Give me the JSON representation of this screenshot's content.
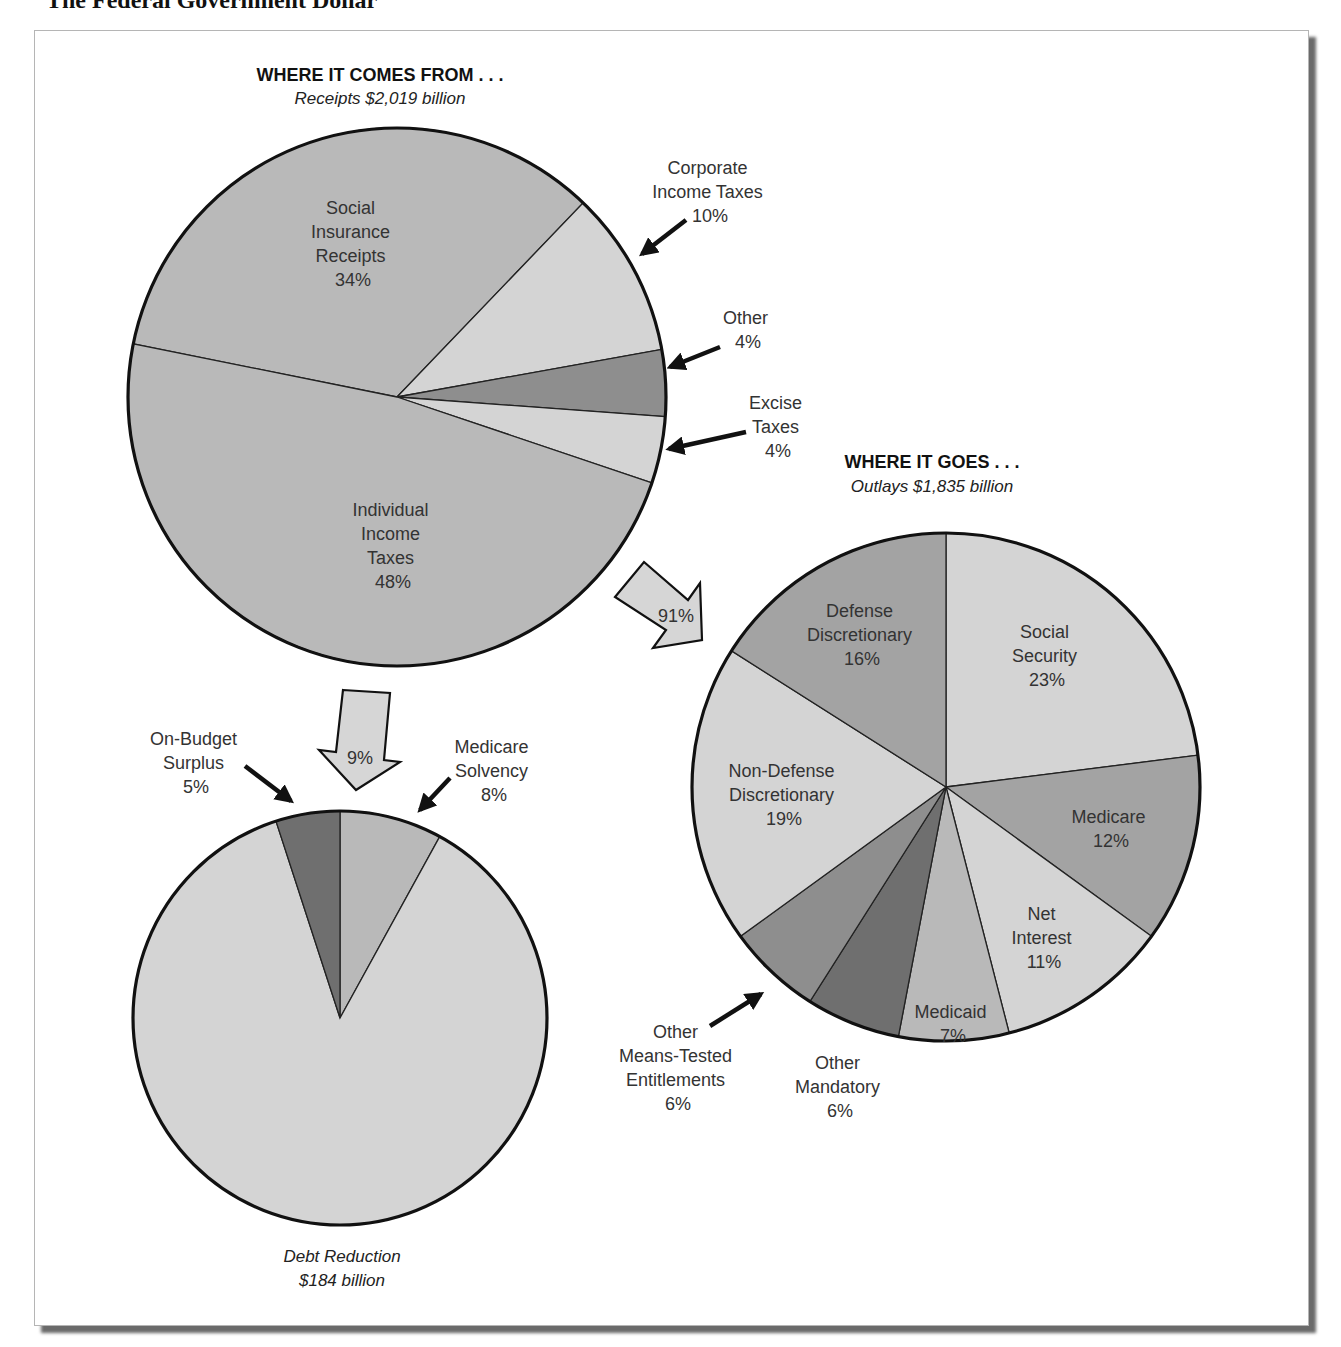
{
  "page": {
    "title": "The Federal Government Dollar"
  },
  "receipts": {
    "header": "WHERE IT COMES FROM . . .",
    "subheader": "Receipts $2,019 billion"
  },
  "outlays": {
    "header": "WHERE IT GOES . . .",
    "subheader": "Outlays $1,835 billion"
  },
  "debt": {
    "caption_line1": "Debt Reduction",
    "caption_line2": "$184 billion"
  },
  "flows": {
    "to_outlays": "91%",
    "to_debt": "9%"
  },
  "colors": {
    "light": "#d4d4d4",
    "mid": "#b9b9b9",
    "midDark": "#a3a3a3",
    "dark": "#8e8e8e",
    "darkest": "#6f6f6f",
    "outline": "#111111"
  },
  "chart_data": [
    {
      "type": "pie",
      "title": "WHERE IT COMES FROM . . .",
      "subtitle": "Receipts $2,019 billion",
      "categories": [
        "Social Insurance Receipts",
        "Corporate Income Taxes",
        "Other",
        "Excise Taxes",
        "Individual Income Taxes"
      ],
      "values": [
        34,
        10,
        4,
        4,
        48
      ],
      "unit": "%"
    },
    {
      "type": "pie",
      "title": "WHERE IT GOES . . .",
      "subtitle": "Outlays $1,835 billion",
      "categories": [
        "Social Security",
        "Medicare",
        "Net Interest",
        "Medicaid",
        "Other Mandatory",
        "Other Means-Tested Entitlements",
        "Non-Defense Discretionary",
        "Defense Discretionary"
      ],
      "values": [
        23,
        12,
        11,
        7,
        6,
        6,
        19,
        16
      ],
      "unit": "%"
    },
    {
      "type": "pie",
      "title": "Debt Reduction",
      "subtitle": "$184 billion",
      "categories": [
        "Medicare Solvency",
        "Debt Reduction (remainder)",
        "On-Budget Surplus"
      ],
      "values": [
        8,
        87,
        5
      ],
      "unit": "%"
    },
    {
      "type": "flow",
      "from": "Receipts",
      "to": [
        "Outlays",
        "Debt Reduction"
      ],
      "values": [
        91,
        9
      ],
      "unit": "%"
    }
  ],
  "labels": {
    "social_insurance": [
      "Social",
      "Insurance",
      "Receipts",
      "34%"
    ],
    "corporate": [
      "Corporate",
      "Income Taxes",
      "10%"
    ],
    "other_receipts": [
      "Other",
      "4%"
    ],
    "excise": [
      "Excise",
      "Taxes",
      "4%"
    ],
    "individual": [
      "Individual",
      "Income",
      "Taxes",
      "48%"
    ],
    "social_security": [
      "Social",
      "Security",
      "23%"
    ],
    "medicare": [
      "Medicare",
      "12%"
    ],
    "net_interest": [
      "Net",
      "Interest",
      "11%"
    ],
    "medicaid": [
      "Medicaid",
      "7%"
    ],
    "other_mandatory": [
      "Other",
      "Mandatory",
      "6%"
    ],
    "other_means_tested": [
      "Other",
      "Means-Tested",
      "Entitlements",
      "6%"
    ],
    "non_defense": [
      "Non-Defense",
      "Discretionary",
      "19%"
    ],
    "defense": [
      "Defense",
      "Discretionary",
      "16%"
    ],
    "on_budget": [
      "On-Budget",
      "Surplus",
      "5%"
    ],
    "medicare_solvency": [
      "Medicare",
      "Solvency",
      "8%"
    ]
  }
}
